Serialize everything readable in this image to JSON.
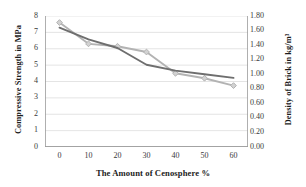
{
  "chart_data": {
    "type": "line",
    "title": "",
    "xlabel": "The Amount of Cenosphere %",
    "ylabel": "Compressive Strength in MPa",
    "ylabel_secondary": "Density of Brick in kg/m³",
    "x": [
      0,
      10,
      20,
      30,
      40,
      50,
      60
    ],
    "xlim": [
      -5,
      65
    ],
    "xticks": [
      "0",
      "10",
      "20",
      "30",
      "40",
      "50",
      "60"
    ],
    "ylim": [
      0,
      8
    ],
    "yticks": [
      "0",
      "1",
      "2",
      "3",
      "4",
      "5",
      "6",
      "7",
      "8"
    ],
    "ylim_secondary": [
      0.0,
      1.8
    ],
    "yticks_secondary": [
      "0.00",
      "0.20",
      "0.40",
      "0.60",
      "0.80",
      "1.00",
      "1.20",
      "1.40",
      "1.60",
      "1.80"
    ],
    "grid": true,
    "grid_color": "#d9d9d9",
    "legend": "none",
    "series": [
      {
        "name": "Compressive Strength in MPa",
        "axis": "left",
        "color": "#b3b3b3",
        "marker": "diamond",
        "values": [
          7.6,
          6.3,
          6.15,
          5.8,
          4.5,
          4.2,
          3.75
        ]
      },
      {
        "name": "Density of Brick in kg/m³",
        "axis": "right",
        "color": "#6e6e6e",
        "marker": "none",
        "values": [
          1.64,
          1.48,
          1.36,
          1.13,
          1.05,
          1.0,
          0.95
        ]
      }
    ]
  }
}
